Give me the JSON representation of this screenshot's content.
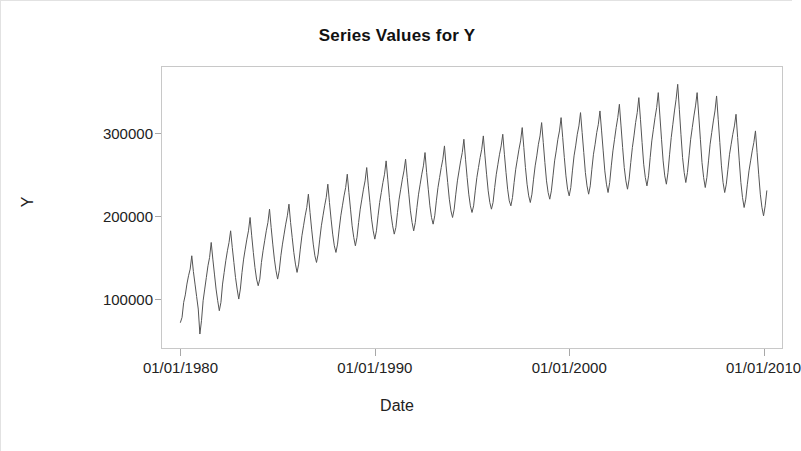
{
  "chart_data": {
    "type": "line",
    "title": "Series Values for Y",
    "xlabel": "Date",
    "ylabel": "Y",
    "grid": false,
    "legend": null,
    "line_color": "#555555",
    "background_color": "#ffffff",
    "frame_color": "#c8c8c8",
    "x_tick_labels": [
      "01/01/1980",
      "01/01/1990",
      "01/01/2000",
      "01/01/2010"
    ],
    "x_tick_values": [
      1980.0,
      1990.0,
      2000.0,
      2010.0
    ],
    "y_tick_labels": [
      "100000",
      "200000",
      "300000"
    ],
    "y_tick_values": [
      100000,
      200000,
      300000
    ],
    "xlim": [
      1979.0,
      2011.0
    ],
    "ylim": [
      40000,
      380000
    ],
    "x_start": 1980.0,
    "x_end": 2010.2,
    "series": [
      {
        "name": "Y",
        "x": [
          1980.0,
          1980.083,
          1980.167,
          1980.25,
          1980.333,
          1980.417,
          1980.5,
          1980.583,
          1980.667,
          1980.75,
          1980.833,
          1980.917,
          1981.0,
          1981.083,
          1981.167,
          1981.25,
          1981.333,
          1981.417,
          1981.5,
          1981.583,
          1981.667,
          1981.75,
          1981.833,
          1981.917,
          1982.0,
          1982.083,
          1982.167,
          1982.25,
          1982.333,
          1982.417,
          1982.5,
          1982.583,
          1982.667,
          1982.75,
          1982.833,
          1982.917,
          1983.0,
          1983.083,
          1983.167,
          1983.25,
          1983.333,
          1983.417,
          1983.5,
          1983.583,
          1983.667,
          1983.75,
          1983.833,
          1983.917,
          1984.0,
          1984.083,
          1984.167,
          1984.25,
          1984.333,
          1984.417,
          1984.5,
          1984.583,
          1984.667,
          1984.75,
          1984.833,
          1984.917,
          1985.0,
          1985.083,
          1985.167,
          1985.25,
          1985.333,
          1985.417,
          1985.5,
          1985.583,
          1985.667,
          1985.75,
          1985.833,
          1985.917,
          1986.0,
          1986.083,
          1986.167,
          1986.25,
          1986.333,
          1986.417,
          1986.5,
          1986.583,
          1986.667,
          1986.75,
          1986.833,
          1986.917,
          1987.0,
          1987.083,
          1987.167,
          1987.25,
          1987.333,
          1987.417,
          1987.5,
          1987.583,
          1987.667,
          1987.75,
          1987.833,
          1987.917,
          1988.0,
          1988.083,
          1988.167,
          1988.25,
          1988.333,
          1988.417,
          1988.5,
          1988.583,
          1988.667,
          1988.75,
          1988.833,
          1988.917,
          1989.0,
          1989.083,
          1989.167,
          1989.25,
          1989.333,
          1989.417,
          1989.5,
          1989.583,
          1989.667,
          1989.75,
          1989.833,
          1989.917,
          1990.0,
          1990.083,
          1990.167,
          1990.25,
          1990.333,
          1990.417,
          1990.5,
          1990.583,
          1990.667,
          1990.75,
          1990.833,
          1990.917,
          1991.0,
          1991.083,
          1991.167,
          1991.25,
          1991.333,
          1991.417,
          1991.5,
          1991.583,
          1991.667,
          1991.75,
          1991.833,
          1991.917,
          1992.0,
          1992.083,
          1992.167,
          1992.25,
          1992.333,
          1992.417,
          1992.5,
          1992.583,
          1992.667,
          1992.75,
          1992.833,
          1992.917,
          1993.0,
          1993.083,
          1993.167,
          1993.25,
          1993.333,
          1993.417,
          1993.5,
          1993.583,
          1993.667,
          1993.75,
          1993.833,
          1993.917,
          1994.0,
          1994.083,
          1994.167,
          1994.25,
          1994.333,
          1994.417,
          1994.5,
          1994.583,
          1994.667,
          1994.75,
          1994.833,
          1994.917,
          1995.0,
          1995.083,
          1995.167,
          1995.25,
          1995.333,
          1995.417,
          1995.5,
          1995.583,
          1995.667,
          1995.75,
          1995.833,
          1995.917,
          1996.0,
          1996.083,
          1996.167,
          1996.25,
          1996.333,
          1996.417,
          1996.5,
          1996.583,
          1996.667,
          1996.75,
          1996.833,
          1996.917,
          1997.0,
          1997.083,
          1997.167,
          1997.25,
          1997.333,
          1997.417,
          1997.5,
          1997.583,
          1997.667,
          1997.75,
          1997.833,
          1997.917,
          1998.0,
          1998.083,
          1998.167,
          1998.25,
          1998.333,
          1998.417,
          1998.5,
          1998.583,
          1998.667,
          1998.75,
          1998.833,
          1998.917,
          1999.0,
          1999.083,
          1999.167,
          1999.25,
          1999.333,
          1999.417,
          1999.5,
          1999.583,
          1999.667,
          1999.75,
          1999.833,
          1999.917,
          2000.0,
          2000.083,
          2000.167,
          2000.25,
          2000.333,
          2000.417,
          2000.5,
          2000.583,
          2000.667,
          2000.75,
          2000.833,
          2000.917,
          2001.0,
          2001.083,
          2001.167,
          2001.25,
          2001.333,
          2001.417,
          2001.5,
          2001.583,
          2001.667,
          2001.75,
          2001.833,
          2001.917,
          2002.0,
          2002.083,
          2002.167,
          2002.25,
          2002.333,
          2002.417,
          2002.5,
          2002.583,
          2002.667,
          2002.75,
          2002.833,
          2002.917,
          2003.0,
          2003.083,
          2003.167,
          2003.25,
          2003.333,
          2003.417,
          2003.5,
          2003.583,
          2003.667,
          2003.75,
          2003.833,
          2003.917,
          2004.0,
          2004.083,
          2004.167,
          2004.25,
          2004.333,
          2004.417,
          2004.5,
          2004.583,
          2004.667,
          2004.75,
          2004.833,
          2004.917,
          2005.0,
          2005.083,
          2005.167,
          2005.25,
          2005.333,
          2005.417,
          2005.5,
          2005.583,
          2005.667,
          2005.75,
          2005.833,
          2005.917,
          2006.0,
          2006.083,
          2006.167,
          2006.25,
          2006.333,
          2006.417,
          2006.5,
          2006.583,
          2006.667,
          2006.75,
          2006.833,
          2006.917,
          2007.0,
          2007.083,
          2007.167,
          2007.25,
          2007.333,
          2007.417,
          2007.5,
          2007.583,
          2007.667,
          2007.75,
          2007.833,
          2007.917,
          2008.0,
          2008.083,
          2008.167,
          2008.25,
          2008.333,
          2008.417,
          2008.5,
          2008.583,
          2008.667,
          2008.75,
          2008.833,
          2008.917,
          2009.0,
          2009.083,
          2009.167,
          2009.25,
          2009.333,
          2009.417,
          2009.5,
          2009.583,
          2009.667,
          2009.75,
          2009.833,
          2009.917,
          2010.0,
          2010.083,
          2010.167
        ],
        "values": [
          72000,
          78000,
          96000,
          105000,
          118000,
          128000,
          136000,
          152000,
          133000,
          118000,
          103000,
          88000,
          58000,
          74000,
          98000,
          112000,
          126000,
          140000,
          150000,
          168000,
          148000,
          130000,
          112000,
          98000,
          86000,
          96000,
          118000,
          132000,
          146000,
          158000,
          168000,
          182000,
          162000,
          144000,
          126000,
          112000,
          100000,
          112000,
          132000,
          148000,
          160000,
          172000,
          182000,
          198000,
          176000,
          156000,
          138000,
          124000,
          116000,
          124000,
          144000,
          158000,
          170000,
          182000,
          192000,
          208000,
          186000,
          166000,
          148000,
          134000,
          124000,
          134000,
          152000,
          166000,
          178000,
          190000,
          200000,
          214000,
          192000,
          174000,
          156000,
          142000,
          132000,
          142000,
          160000,
          176000,
          188000,
          200000,
          210000,
          226000,
          204000,
          184000,
          166000,
          152000,
          144000,
          154000,
          172000,
          188000,
          200000,
          212000,
          222000,
          238000,
          216000,
          196000,
          178000,
          164000,
          156000,
          166000,
          184000,
          200000,
          212000,
          224000,
          234000,
          250000,
          228000,
          208000,
          188000,
          174000,
          164000,
          174000,
          192000,
          208000,
          220000,
          232000,
          242000,
          258000,
          236000,
          216000,
          196000,
          182000,
          172000,
          182000,
          200000,
          216000,
          228000,
          240000,
          250000,
          266000,
          244000,
          222000,
          202000,
          188000,
          178000,
          186000,
          204000,
          220000,
          232000,
          244000,
          254000,
          268000,
          246000,
          226000,
          206000,
          192000,
          182000,
          192000,
          210000,
          226000,
          238000,
          250000,
          260000,
          276000,
          252000,
          232000,
          212000,
          198000,
          190000,
          200000,
          218000,
          234000,
          246000,
          258000,
          268000,
          284000,
          260000,
          240000,
          220000,
          206000,
          198000,
          208000,
          226000,
          242000,
          254000,
          266000,
          276000,
          292000,
          268000,
          246000,
          226000,
          212000,
          204000,
          212000,
          230000,
          246000,
          258000,
          270000,
          280000,
          296000,
          272000,
          250000,
          230000,
          216000,
          208000,
          216000,
          234000,
          250000,
          262000,
          274000,
          284000,
          298000,
          274000,
          252000,
          232000,
          218000,
          212000,
          222000,
          240000,
          256000,
          268000,
          280000,
          290000,
          306000,
          282000,
          258000,
          238000,
          224000,
          216000,
          226000,
          244000,
          260000,
          272000,
          286000,
          296000,
          312000,
          288000,
          264000,
          242000,
          228000,
          220000,
          230000,
          248000,
          266000,
          278000,
          292000,
          302000,
          318000,
          294000,
          270000,
          248000,
          232000,
          224000,
          234000,
          254000,
          272000,
          284000,
          298000,
          308000,
          324000,
          300000,
          276000,
          252000,
          236000,
          226000,
          236000,
          256000,
          274000,
          286000,
          300000,
          310000,
          326000,
          302000,
          278000,
          254000,
          238000,
          228000,
          240000,
          260000,
          278000,
          292000,
          306000,
          318000,
          334000,
          308000,
          282000,
          258000,
          242000,
          232000,
          244000,
          264000,
          282000,
          296000,
          312000,
          324000,
          342000,
          316000,
          288000,
          262000,
          246000,
          236000,
          248000,
          270000,
          290000,
          304000,
          318000,
          330000,
          348000,
          320000,
          292000,
          266000,
          248000,
          238000,
          252000,
          274000,
          294000,
          310000,
          326000,
          340000,
          358000,
          328000,
          298000,
          270000,
          252000,
          240000,
          252000,
          272000,
          292000,
          306000,
          320000,
          332000,
          348000,
          320000,
          292000,
          264000,
          246000,
          234000,
          246000,
          266000,
          286000,
          300000,
          314000,
          326000,
          344000,
          316000,
          288000,
          260000,
          240000,
          228000,
          238000,
          256000,
          274000,
          286000,
          298000,
          308000,
          322000,
          294000,
          266000,
          240000,
          222000,
          210000,
          220000,
          238000,
          254000,
          266000,
          278000,
          288000,
          302000,
          276000,
          250000,
          226000,
          210000,
          200000,
          212000,
          230000
        ]
      }
    ]
  },
  "title": "Series Values for Y",
  "axes": {
    "y_title": "Y",
    "x_title": "Date"
  }
}
